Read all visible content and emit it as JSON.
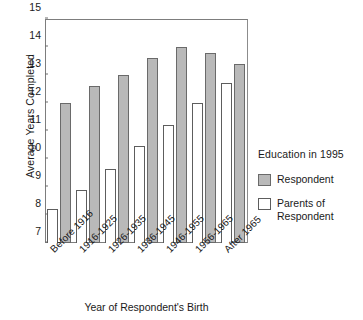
{
  "chart_data": {
    "type": "bar",
    "title": "",
    "xlabel": "Year of Respondent's Birth",
    "ylabel": "Average Years Completed",
    "ylim": [
      7,
      15
    ],
    "yticks": [
      7,
      8,
      9,
      10,
      11,
      12,
      13,
      14,
      15
    ],
    "grid": false,
    "legend_position": "right",
    "legend_title": "Education in 1995",
    "categories": [
      "Before 1916",
      "1916-1925",
      "1926-1935",
      "1936-1945",
      "1946-1955",
      "1956-1965",
      "After 1965"
    ],
    "series": [
      {
        "name": "Parents of Respondent",
        "color": "#ffffff",
        "values": [
          8.2,
          8.9,
          9.65,
          10.45,
          11.2,
          12.0,
          12.7
        ]
      },
      {
        "name": "Respondent",
        "color": "#b9b9b9",
        "values": [
          12.0,
          12.6,
          13.0,
          13.6,
          14.0,
          13.8,
          13.4
        ]
      }
    ]
  },
  "legend": {
    "title": "Education in 1995",
    "entries": [
      {
        "label": "Respondent",
        "swatch": "respondent"
      },
      {
        "label": "Parents of\nRespondent",
        "swatch": "parents"
      }
    ],
    "respondent_label": "Respondent",
    "parents_label_line1": "Parents of",
    "parents_label_line2": "Respondent"
  },
  "axes": {
    "y_title": "Average Years Completed",
    "x_title": "Year of Respondent's Birth"
  }
}
